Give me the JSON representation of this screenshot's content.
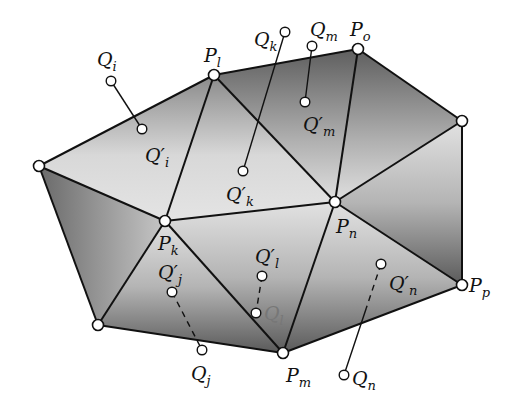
{
  "diagram": {
    "colors": {
      "line": "#111111",
      "fill_dark": "#6a6a6a",
      "fill_light": "#e6e6e6",
      "point_fill": "#ffffff"
    },
    "vertices": [
      {
        "id": "Pl",
        "base": "P",
        "sub": "l",
        "x": 214,
        "y": 75,
        "label_x": 204,
        "label_y": 62
      },
      {
        "id": "Po",
        "base": "P",
        "sub": "o",
        "x": 358,
        "y": 49,
        "label_x": 350,
        "label_y": 36
      },
      {
        "id": "Vr",
        "base": "",
        "sub": "",
        "x": 462,
        "y": 121
      },
      {
        "id": "Vl",
        "base": "",
        "sub": "",
        "x": 39,
        "y": 166
      },
      {
        "id": "Pk",
        "base": "P",
        "sub": "k",
        "x": 165,
        "y": 221,
        "label_x": 158,
        "label_y": 250
      },
      {
        "id": "Pn",
        "base": "P",
        "sub": "n",
        "x": 335,
        "y": 202,
        "label_x": 336,
        "label_y": 233
      },
      {
        "id": "Pp",
        "base": "P",
        "sub": "p",
        "x": 462,
        "y": 285,
        "label_x": 469,
        "label_y": 292
      },
      {
        "id": "Vb",
        "base": "",
        "sub": "",
        "x": 98,
        "y": 325
      },
      {
        "id": "Pm",
        "base": "P",
        "sub": "m",
        "x": 283,
        "y": 353,
        "label_x": 286,
        "label_y": 382
      }
    ],
    "edges": [
      [
        "Vl",
        "Pl"
      ],
      [
        "Pl",
        "Po"
      ],
      [
        "Po",
        "Vr"
      ],
      [
        "Vr",
        "Pp"
      ],
      [
        "Pp",
        "Pm"
      ],
      [
        "Pm",
        "Vb"
      ],
      [
        "Vb",
        "Vl"
      ],
      [
        "Vl",
        "Pk"
      ],
      [
        "Pl",
        "Pk"
      ],
      [
        "Pl",
        "Pn"
      ],
      [
        "Po",
        "Pn"
      ],
      [
        "Vr",
        "Pn"
      ],
      [
        "Pk",
        "Pn"
      ],
      [
        "Pk",
        "Vb"
      ],
      [
        "Pk",
        "Pm"
      ],
      [
        "Pn",
        "Pm"
      ],
      [
        "Pn",
        "Pp"
      ]
    ],
    "triangles": [
      {
        "pts": [
          "Vl",
          "Pl",
          "Pk"
        ],
        "shade": "light"
      },
      {
        "pts": [
          "Pl",
          "Pn",
          "Pk"
        ],
        "shade": "light"
      },
      {
        "pts": [
          "Pl",
          "Po",
          "Pn"
        ],
        "shade": "dark"
      },
      {
        "pts": [
          "Po",
          "Vr",
          "Pn"
        ],
        "shade": "dark"
      },
      {
        "pts": [
          "Vr",
          "Pp",
          "Pn"
        ],
        "shade": "mid"
      },
      {
        "pts": [
          "Pn",
          "Pp",
          "Pm"
        ],
        "shade": "mid"
      },
      {
        "pts": [
          "Pk",
          "Pn",
          "Pm"
        ],
        "shade": "mid"
      },
      {
        "pts": [
          "Pk",
          "Pm",
          "Vb"
        ],
        "shade": "mid"
      },
      {
        "pts": [
          "Vl",
          "Pk",
          "Vb"
        ],
        "shade": "side"
      }
    ],
    "points": [
      {
        "id": "Qi",
        "base": "Q",
        "sub": "i",
        "x": 111,
        "y": 81,
        "label_x": 97,
        "label_y": 66
      },
      {
        "id": "Q'i",
        "base": "Q′",
        "sub": "i",
        "x": 142,
        "y": 129,
        "label_x": 145,
        "label_y": 162
      },
      {
        "id": "Qk",
        "base": "Q",
        "sub": "k",
        "x": 285,
        "y": 32,
        "label_x": 254,
        "label_y": 46
      },
      {
        "id": "Q'k",
        "base": "Q′",
        "sub": "k",
        "x": 243,
        "y": 171,
        "label_x": 226,
        "label_y": 201
      },
      {
        "id": "Qm",
        "base": "Q",
        "sub": "m",
        "x": 312,
        "y": 46,
        "label_x": 310,
        "label_y": 36
      },
      {
        "id": "Q'm",
        "base": "Q′",
        "sub": "m",
        "x": 305,
        "y": 102,
        "label_x": 303,
        "label_y": 131
      },
      {
        "id": "Q'j",
        "base": "Q′",
        "sub": "j",
        "x": 172,
        "y": 292,
        "label_x": 158,
        "label_y": 279
      },
      {
        "id": "Qj",
        "base": "Q",
        "sub": "j",
        "x": 202,
        "y": 350,
        "label_x": 191,
        "label_y": 380
      },
      {
        "id": "Q'l",
        "base": "Q′",
        "sub": "l",
        "x": 262,
        "y": 276,
        "label_x": 255,
        "label_y": 263
      },
      {
        "id": "Ql",
        "base": "Q",
        "sub": "l",
        "x": 256,
        "y": 313,
        "label_x": 264,
        "label_y": 320,
        "faint": true
      },
      {
        "id": "Q'n",
        "base": "Q′",
        "sub": "n",
        "x": 381,
        "y": 264,
        "label_x": 389,
        "label_y": 290
      },
      {
        "id": "Qn",
        "base": "Q",
        "sub": "n",
        "x": 344,
        "y": 375,
        "label_x": 352,
        "label_y": 385
      }
    ],
    "links": [
      {
        "from": "Qi",
        "to": "Q'i",
        "style": "solid"
      },
      {
        "from": "Qk",
        "to": "Q'k",
        "style": "solid"
      },
      {
        "from": "Qm",
        "to": "Q'm",
        "style": "solid"
      },
      {
        "from": "Q'j",
        "to": "Qj",
        "style": "dashed"
      },
      {
        "from": "Q'l",
        "to": "Ql",
        "style": "dashed"
      },
      {
        "from": "Q'n",
        "to": "Qn",
        "style": "mixed",
        "break_y": 308
      }
    ]
  }
}
